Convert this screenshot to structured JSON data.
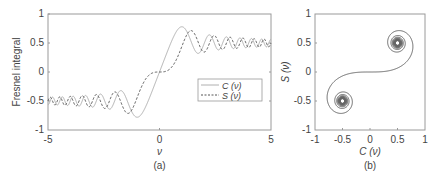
{
  "chart_data": [
    {
      "id": "a",
      "type": "line",
      "caption": "(a)",
      "title": "",
      "xlabel": "ν",
      "ylabel": "Fresnel integral",
      "xlim": [
        -5,
        5
      ],
      "ylim": [
        -1,
        1
      ],
      "xticks": [
        "-5",
        "0",
        "5"
      ],
      "yticks": [
        "-1",
        "-0.5",
        "0",
        "0.5",
        "1"
      ],
      "grid": false,
      "legend": {
        "position": "inside-right",
        "entries": [
          "C (ν)",
          "S (ν)"
        ]
      },
      "x": [
        -5,
        -4,
        -3,
        -2,
        -1.5,
        -1.2,
        -1,
        -0.5,
        0,
        0.5,
        1,
        1.2,
        1.5,
        2,
        3,
        4,
        5
      ],
      "series": [
        {
          "name": "C (ν)",
          "style": "solid",
          "values": [
            -0.564,
            -0.498,
            -0.606,
            -0.488,
            -0.445,
            -0.715,
            -0.78,
            -0.492,
            0,
            0.492,
            0.78,
            0.715,
            0.445,
            0.488,
            0.606,
            0.498,
            0.564
          ]
        },
        {
          "name": "S (ν)",
          "style": "dashed",
          "values": [
            -0.499,
            -0.421,
            -0.496,
            -0.343,
            -0.697,
            -0.623,
            -0.438,
            -0.065,
            0,
            0.065,
            0.438,
            0.623,
            0.697,
            0.343,
            0.496,
            0.421,
            0.499
          ]
        }
      ]
    },
    {
      "id": "b",
      "type": "line",
      "caption": "(b)",
      "title": "",
      "xlabel": "C (ν)",
      "ylabel": "S (ν)",
      "xlim": [
        -1,
        1
      ],
      "ylim": [
        -1,
        1
      ],
      "xticks": [
        "-1",
        "-0.5",
        "0",
        "0.5",
        "1"
      ],
      "yticks": [
        "-1",
        "-0.5",
        "0",
        "0.5",
        "1"
      ],
      "grid": false,
      "description": "Cornu spiral (Euler spiral): parametric plot of S(ν) vs C(ν), spiraling toward (0.5, 0.5) and (-0.5, -0.5)",
      "series": [
        {
          "name": "Cornu spiral",
          "style": "solid",
          "points": [
            [
              -0.5,
              -0.5
            ],
            [
              -0.78,
              -0.44
            ],
            [
              -0.49,
              -0.07
            ],
            [
              0,
              0
            ],
            [
              0.49,
              0.07
            ],
            [
              0.78,
              0.44
            ],
            [
              0.5,
              0.5
            ]
          ]
        }
      ]
    }
  ],
  "plot_a": {
    "range": {
      "x0": -5,
      "x1": 5,
      "y0": -1,
      "y1": 1
    },
    "box": {
      "left": 48,
      "right": 271,
      "top": 14,
      "bottom": 130
    }
  },
  "plot_b": {
    "range": {
      "x0": -1,
      "x1": 1,
      "y0": -1,
      "y1": 1
    },
    "box": {
      "left": 315,
      "right": 425,
      "top": 14,
      "bottom": 130
    }
  },
  "colors": {
    "axis": "#9a9a9a",
    "line_c": "#b0b0b0",
    "line_s": "#555555",
    "spiral": "#666666"
  }
}
